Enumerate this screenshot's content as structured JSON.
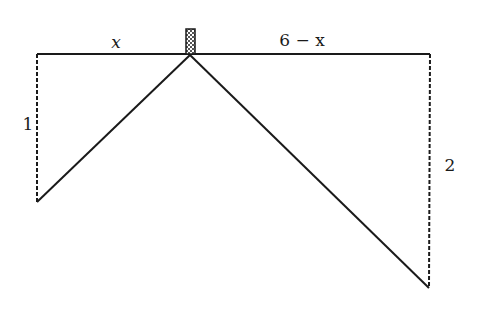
{
  "diagram": {
    "type": "geometry-optimization-sketch",
    "labels": {
      "left_segment": "x",
      "right_segment": "6 − x",
      "left_height": "1",
      "right_height": "2"
    },
    "colors": {
      "stroke": "#1a1a1a",
      "background": "#ffffff",
      "box_fill": "#d9d9d9"
    },
    "points": {
      "top_left": [
        37,
        54
      ],
      "apex": [
        190,
        55
      ],
      "top_right": [
        430,
        54
      ],
      "left_bottom": [
        37,
        202
      ],
      "right_bottom": [
        429,
        288
      ]
    },
    "box": {
      "x": 186,
      "y": 29,
      "width": 9,
      "height": 25
    }
  }
}
